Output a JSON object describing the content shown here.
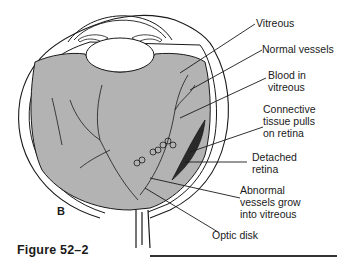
{
  "figure": {
    "caption": "Figure 52–2",
    "panel_letter": "B",
    "labels": [
      {
        "id": "vitreous",
        "text": "Vitreous"
      },
      {
        "id": "normal-vessels",
        "text": "Normal vessels"
      },
      {
        "id": "blood-in-vitreous-1",
        "text": "Blood in"
      },
      {
        "id": "blood-in-vitreous-2",
        "text": "vitreous"
      },
      {
        "id": "connective-1",
        "text": "Connective"
      },
      {
        "id": "connective-2",
        "text": "tissue pulls"
      },
      {
        "id": "connective-3",
        "text": "on retina"
      },
      {
        "id": "detached-1",
        "text": "Detached"
      },
      {
        "id": "detached-2",
        "text": "retina"
      },
      {
        "id": "abnormal-1",
        "text": "Abnormal"
      },
      {
        "id": "abnormal-2",
        "text": "vessels grow"
      },
      {
        "id": "abnormal-3",
        "text": "into vitreous"
      },
      {
        "id": "optic-disk",
        "text": "Optic disk"
      }
    ],
    "colors": {
      "vitreous_fill": "#b3b3b3",
      "detached_retina": "#2a2a2a",
      "outline": "#1a1a1a"
    }
  }
}
